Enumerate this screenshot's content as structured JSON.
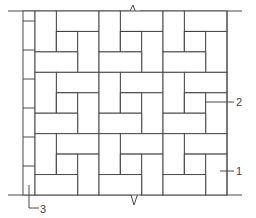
{
  "diagram": {
    "type": "paving-pattern-plan",
    "grid": {
      "tiles_x": 3,
      "tiles_y": 3,
      "origin": [
        35,
        11
      ],
      "tile_width": 64,
      "tile_height": 61.33
    },
    "border_strip": {
      "x": [
        23,
        35
      ],
      "y": [
        11,
        195
      ],
      "divisions_y": [
        21,
        50,
        79,
        108,
        137,
        166
      ]
    },
    "break_marks": [
      "top",
      "bottom"
    ],
    "callouts": [
      {
        "id": "1",
        "label": "1",
        "target": "paving-brick"
      },
      {
        "id": "2",
        "label": "2",
        "target": "hatched-insert"
      },
      {
        "id": "3",
        "label": "3",
        "target": "border-strip"
      }
    ],
    "colors": {
      "line": "#4a4a4a",
      "background": "#ffffff",
      "text": "#444444"
    }
  }
}
